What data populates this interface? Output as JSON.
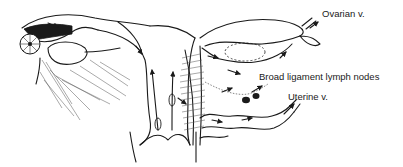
{
  "figure": {
    "labels": {
      "ovarian_vein": "Ovarian v.",
      "broad_ligament_nodes": "Broad ligament lymph nodes",
      "uterine_vein": "Uterine v."
    }
  }
}
